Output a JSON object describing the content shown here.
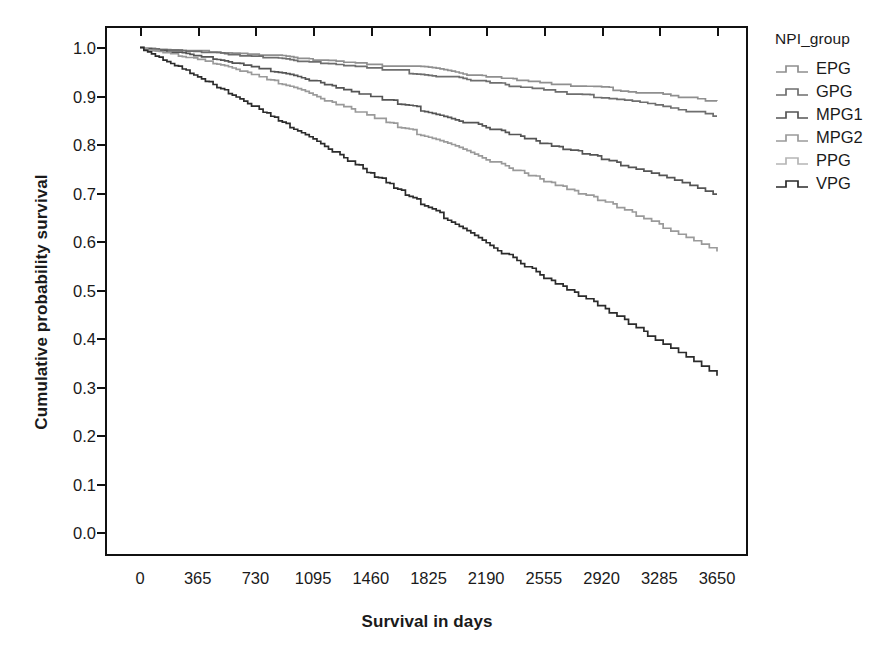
{
  "chart_data": {
    "type": "line",
    "title": "",
    "subtitle": "",
    "xlabel": "Survival in days",
    "ylabel": "Cumulative probability survival",
    "xlim": [
      0,
      3650
    ],
    "ylim": [
      0.0,
      1.0
    ],
    "grid": false,
    "legend_position": "right",
    "legend_title": "NPI_group",
    "x_ticks": [
      "0",
      "365",
      "730",
      "1095",
      "1460",
      "1825",
      "2190",
      "2555",
      "2920",
      "3285",
      "3650"
    ],
    "x_tick_values": [
      0,
      365,
      730,
      1095,
      1460,
      1825,
      2190,
      2555,
      2920,
      3285,
      3650
    ],
    "y_ticks": [
      "0.0",
      "0.1",
      "0.2",
      "0.3",
      "0.4",
      "0.5",
      "0.6",
      "0.7",
      "0.8",
      "0.9",
      "1.0"
    ],
    "y_tick_values": [
      0.0,
      0.1,
      0.2,
      0.3,
      0.4,
      0.5,
      0.6,
      0.7,
      0.8,
      0.9,
      1.0
    ],
    "x": [
      0,
      365,
      730,
      1095,
      1460,
      1825,
      2190,
      2555,
      2920,
      3285,
      3650
    ],
    "series": [
      {
        "name": "EPG",
        "color": "#8f8f8f",
        "values": [
          1.0,
          0.995,
          0.988,
          0.978,
          0.968,
          0.957,
          0.944,
          0.931,
          0.921,
          0.908,
          0.895
        ]
      },
      {
        "name": "GPG",
        "color": "#6e6e6e",
        "values": [
          1.0,
          0.993,
          0.984,
          0.972,
          0.96,
          0.947,
          0.932,
          0.916,
          0.901,
          0.883,
          0.865
        ]
      },
      {
        "name": "MPG1",
        "color": "#555555",
        "values": [
          1.0,
          0.985,
          0.962,
          0.933,
          0.902,
          0.87,
          0.838,
          0.806,
          0.775,
          0.738,
          0.7
        ]
      },
      {
        "name": "MPG2",
        "color": "#9a9a9a",
        "values": [
          1.0,
          0.978,
          0.945,
          0.903,
          0.86,
          0.816,
          0.772,
          0.728,
          0.688,
          0.637,
          0.585
        ]
      },
      {
        "name": "PPG",
        "color": "#b5b5b5",
        "values": [
          1.0,
          0.992,
          0.98,
          0.966,
          0.951,
          0.936,
          0.92,
          0.903,
          0.886,
          0.868,
          0.85
        ]
      },
      {
        "name": "VPG",
        "color": "#2b2b2b",
        "values": [
          1.0,
          0.942,
          0.878,
          0.812,
          0.742,
          0.672,
          0.598,
          0.53,
          0.468,
          0.398,
          0.33
        ]
      }
    ],
    "visible_series": [
      "EPG",
      "GPG",
      "MPG1",
      "MPG2",
      "VPG"
    ]
  },
  "legend": {
    "title": "NPI_group",
    "items": [
      {
        "label": "EPG",
        "color": "#8f8f8f"
      },
      {
        "label": "GPG",
        "color": "#6e6e6e"
      },
      {
        "label": "MPG1",
        "color": "#555555"
      },
      {
        "label": "MPG2",
        "color": "#9a9a9a"
      },
      {
        "label": "PPG",
        "color": "#b5b5b5"
      },
      {
        "label": "VPG",
        "color": "#2b2b2b"
      }
    ]
  }
}
